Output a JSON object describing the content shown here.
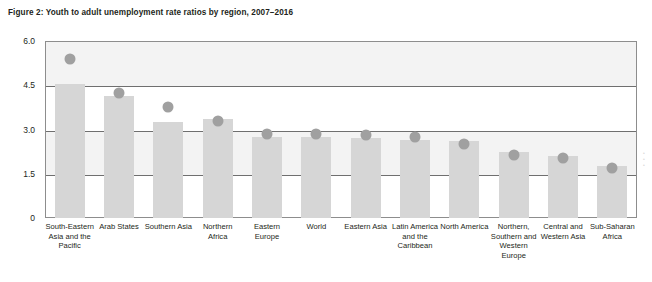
{
  "figure": {
    "title": "Figure 2: Youth to adult unemployment rate ratios by region, 2007–2016"
  },
  "chart_data": {
    "type": "bar",
    "title": "Figure 2: Youth to adult unemployment rate ratios by region, 2007–2016",
    "xlabel": "",
    "ylabel": "",
    "ylim": [
      0,
      6.0
    ],
    "yticks": [
      "0",
      "1.5",
      "3.0",
      "4.5",
      "6.0"
    ],
    "ytick_values": [
      0,
      1.5,
      3.0,
      4.5,
      6.0
    ],
    "grid": true,
    "legend": "none",
    "categories": [
      "South-Eastern Asia and the Pacific",
      "Arab States",
      "Southern Asia",
      "Northern Africa",
      "Eastern Europe",
      "World",
      "Eastern Asia",
      "Latin America and the Caribbean",
      "North America",
      "Northern, Southern and Western Europe",
      "Central and Western Asia",
      "Sub-Saharan Africa"
    ],
    "series": [
      {
        "name": "2016 ratio (bar)",
        "type": "bar",
        "color": "#d6d6d6",
        "values": [
          4.55,
          4.15,
          3.25,
          3.35,
          2.75,
          2.75,
          2.7,
          2.65,
          2.6,
          2.25,
          2.1,
          1.75
        ]
      },
      {
        "name": "2007 ratio (dot)",
        "type": "scatter",
        "color": "#a0a0a0",
        "values": [
          5.4,
          4.25,
          3.75,
          3.3,
          2.85,
          2.85,
          2.8,
          2.75,
          2.5,
          2.15,
          2.05,
          1.68
        ]
      }
    ]
  },
  "artifacts": {
    "right_edge_marks": [
      "•",
      "•",
      "•"
    ]
  }
}
